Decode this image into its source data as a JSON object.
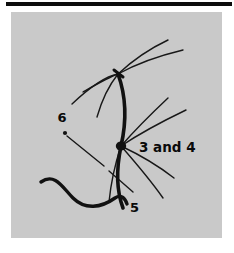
{
  "page": {
    "background_color": "#ffffff",
    "rule_color": "#0d0d0d"
  },
  "figure": {
    "panel_color": "#c9c9c9",
    "ink_color": "#141414",
    "labels": [
      {
        "id": "label-6",
        "text": "6",
        "x": 51,
        "y": 110
      },
      {
        "id": "label-3-and-4",
        "text": "3 and 4",
        "x": 128,
        "y": 140
      },
      {
        "id": "label-5",
        "text": "5",
        "x": 119,
        "y": 200
      }
    ],
    "nodes": [
      {
        "id": "upper-junction",
        "x": 107,
        "y": 62
      },
      {
        "id": "main-node",
        "x": 110,
        "y": 134
      },
      {
        "id": "point-6",
        "x": 54,
        "y": 121
      }
    ]
  }
}
